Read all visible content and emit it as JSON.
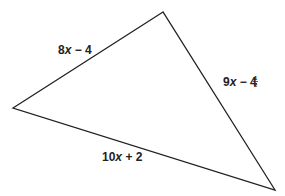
{
  "diagram": {
    "type": "triangle",
    "vertices": {
      "top": [
        163,
        12
      ],
      "left": [
        13,
        108
      ],
      "bottom_right": [
        275,
        190
      ]
    },
    "stroke_color": "#222222",
    "sides": {
      "left_side": {
        "coef": "8",
        "var": "x",
        "rest": " − 4"
      },
      "right_side": {
        "coef": "9",
        "var": "x",
        "rest": " − 4",
        "frac_num": "1",
        "frac_den": "2"
      },
      "bottom_side": {
        "coef": "10",
        "var": "x",
        "rest": " + 2"
      }
    }
  }
}
